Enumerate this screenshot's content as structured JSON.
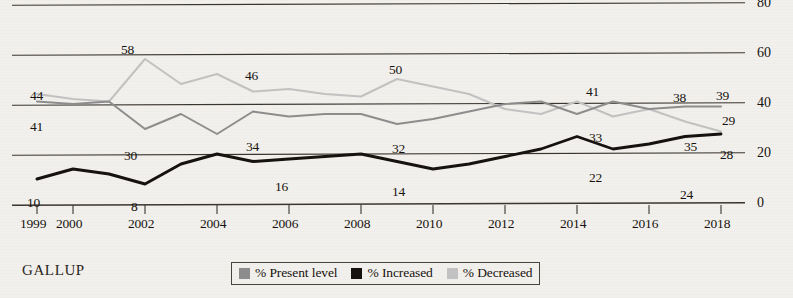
{
  "source": {
    "wordmark": "GALLUP"
  },
  "legend": {
    "items": [
      {
        "label": "% Present level",
        "color": "#8d8d8d",
        "swatch_name": "legend-swatch-present-level"
      },
      {
        "label": "% Increased",
        "color": "#16120f",
        "swatch_name": "legend-swatch-increased"
      },
      {
        "label": "% Decreased",
        "color": "#c2c2c2",
        "swatch_name": "legend-swatch-decreased"
      }
    ]
  },
  "chart_data": {
    "type": "line",
    "title": "",
    "xlabel": "",
    "ylabel": "",
    "ylim": [
      0,
      85
    ],
    "xlim": [
      1999,
      2018
    ],
    "grid": true,
    "legend_position": "bottom-center",
    "y_ticks": [
      0,
      20,
      40,
      60,
      80
    ],
    "y_tick_labels": [
      "0",
      "20",
      "40",
      "60",
      "80"
    ],
    "y_axis_side": "right",
    "x": [
      1999,
      2000,
      2001,
      2002,
      2003,
      2004,
      2005,
      2006,
      2007,
      2008,
      2009,
      2010,
      2011,
      2012,
      2013,
      2014,
      2015,
      2016,
      2017,
      2018
    ],
    "x_tick_values": [
      1999,
      2000,
      2002,
      2004,
      2006,
      2008,
      2010,
      2012,
      2014,
      2016,
      2018
    ],
    "x_tick_labels": [
      "1999",
      "2000",
      "2002",
      "2004",
      "2006",
      "2008",
      "2010",
      "2012",
      "2014",
      "2016",
      "2018"
    ],
    "series": [
      {
        "name": "% Present level",
        "color": "#8d8d8d",
        "values": [
          41,
          40,
          41,
          30,
          36,
          28,
          37,
          35,
          36,
          36,
          32,
          34,
          37,
          40,
          41,
          36,
          41,
          38,
          39,
          39
        ]
      },
      {
        "name": "% Increased",
        "color": "#16120f",
        "values": [
          10,
          14,
          12,
          8,
          16,
          20,
          17,
          18,
          19,
          20,
          17,
          14,
          16,
          19,
          22,
          27,
          22,
          24,
          27,
          28
        ]
      },
      {
        "name": "% Decreased",
        "color": "#c2c2c2",
        "values": [
          44,
          42,
          41,
          58,
          48,
          52,
          45,
          46,
          44,
          43,
          50,
          47,
          44,
          38,
          36,
          41,
          35,
          38,
          33,
          29
        ]
      }
    ],
    "point_labels": [
      {
        "series": "% Decreased",
        "year": 1999,
        "text": "44",
        "x": 30,
        "y": 88
      },
      {
        "series": "% Present level",
        "year": 1999,
        "text": "41",
        "x": 30,
        "y": 119
      },
      {
        "series": "% Increased",
        "year": 1999,
        "text": "10",
        "x": 27,
        "y": 195
      },
      {
        "series": "% Decreased",
        "year": 2002,
        "text": "58",
        "x": 121,
        "y": 42
      },
      {
        "series": "% Present level",
        "year": 2002,
        "text": "30",
        "x": 124,
        "y": 148
      },
      {
        "series": "% Increased",
        "year": 2002,
        "text": "8",
        "x": 131,
        "y": 199
      },
      {
        "series": "% Decreased",
        "year": 2005,
        "text": "46",
        "x": 245,
        "y": 68
      },
      {
        "series": "% Present level",
        "year": 2005,
        "text": "34",
        "x": 246,
        "y": 139
      },
      {
        "series": "% Increased",
        "year": 2005,
        "text": "16",
        "x": 275,
        "y": 179
      },
      {
        "series": "% Decreased",
        "year": 2009,
        "text": "50",
        "x": 389,
        "y": 62
      },
      {
        "series": "% Present level",
        "year": 2009,
        "text": "32",
        "x": 392,
        "y": 141
      },
      {
        "series": "% Increased",
        "year": 2009,
        "text": "14",
        "x": 392,
        "y": 184
      },
      {
        "series": "% Present level",
        "year": 2014,
        "text": "41",
        "x": 586,
        "y": 84
      },
      {
        "series": "% Increased",
        "year": 2014,
        "text": "33",
        "x": 589,
        "y": 130
      },
      {
        "series": "% Increased",
        "year": 2014,
        "text": "22",
        "x": 589,
        "y": 170
      },
      {
        "series": "% Present level",
        "year": 2016,
        "text": "38",
        "x": 673,
        "y": 90
      },
      {
        "series": "% Increased",
        "year": 2016,
        "text": "24",
        "x": 680,
        "y": 187
      },
      {
        "series": "% Present level",
        "year": 2018,
        "text": "39",
        "x": 716,
        "y": 88
      },
      {
        "series": "% Decreased",
        "year": 2018,
        "text": "29",
        "x": 722,
        "y": 113
      },
      {
        "series": "% Increased",
        "year": 2017,
        "text": "35",
        "x": 684,
        "y": 139
      },
      {
        "series": "% Increased",
        "year": 2018,
        "text": "28",
        "x": 720,
        "y": 147
      }
    ]
  }
}
